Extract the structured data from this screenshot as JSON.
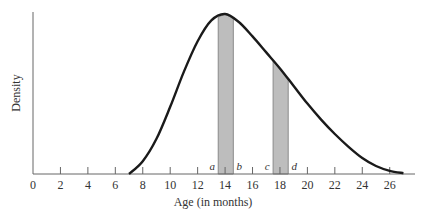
{
  "chart_data": {
    "type": "area",
    "title": "",
    "xlabel": "Age (in months)",
    "ylabel": "Density",
    "xlim": [
      0,
      27.5
    ],
    "x_ticks": [
      0,
      2,
      4,
      6,
      8,
      10,
      12,
      14,
      16,
      18,
      20,
      22,
      24,
      26
    ],
    "grid": false,
    "curve": {
      "description": "Right-skewed density curve starting near 7, peak near 14, tapering to ~27",
      "x": [
        7,
        8,
        9,
        10,
        11,
        12,
        13,
        14,
        15,
        16,
        17,
        18,
        19,
        20,
        21,
        22,
        23,
        24,
        25,
        26,
        27
      ],
      "y": [
        0,
        0.08,
        0.22,
        0.42,
        0.64,
        0.83,
        0.96,
        1.0,
        0.95,
        0.86,
        0.76,
        0.66,
        0.55,
        0.44,
        0.34,
        0.25,
        0.17,
        0.1,
        0.05,
        0.02,
        0.005
      ]
    },
    "shaded_regions": [
      {
        "from_label": "a",
        "to_label": "b",
        "from": 13.5,
        "to": 14.6
      },
      {
        "from_label": "c",
        "to_label": "d",
        "from": 17.5,
        "to": 18.6
      }
    ],
    "annotations": [
      "a",
      "b",
      "c",
      "d"
    ]
  }
}
